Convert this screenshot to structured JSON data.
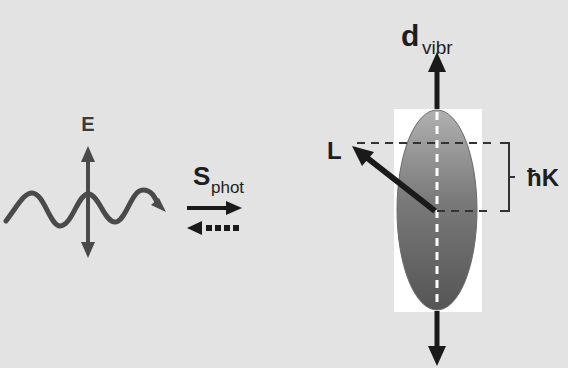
{
  "diagram": {
    "title": "",
    "colors": {
      "background": "#e3e3e3",
      "wave": "#4a4a4a",
      "arrow_dark": "#1a1a1a",
      "ellipse_top": "#a8a8a8",
      "ellipse_bottom": "#555555",
      "highlight_box": "#ffffff"
    },
    "light_wave": {
      "field_label": "E",
      "icon": "wave-icon"
    },
    "photon_spin": {
      "symbol": "S",
      "subscript": "phot",
      "forward_arrow": "solid-right-arrow",
      "backward_arrow": "dotted-left-arrow"
    },
    "molecule": {
      "dipole_symbol": "d",
      "dipole_subscript": "vibr",
      "angular_momentum_label": "L",
      "projection_label": "ħK"
    }
  }
}
